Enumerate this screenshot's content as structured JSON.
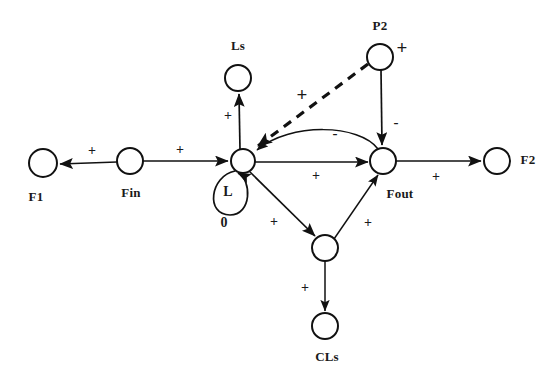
{
  "diagram": {
    "type": "signed-directed-graph",
    "background_color": "#ffffff",
    "stroke_color": "#111111",
    "nodes": [
      {
        "id": "F1",
        "label": "F1",
        "cx": 43,
        "cy": 163,
        "r": 14,
        "label_x": 36,
        "label_y": 197
      },
      {
        "id": "Fin",
        "label": "Fin",
        "cx": 130,
        "cy": 161,
        "r": 13,
        "label_x": 131,
        "label_y": 193
      },
      {
        "id": "L",
        "label": "",
        "cx": 243,
        "cy": 161,
        "r": 12,
        "label_x": 0,
        "label_y": 0
      },
      {
        "id": "Ls",
        "label": "Ls",
        "cx": 238,
        "cy": 78,
        "r": 13,
        "label_x": 238,
        "label_y": 46
      },
      {
        "id": "P2",
        "label": "P2",
        "cx": 380,
        "cy": 57,
        "r": 13,
        "label_x": 380,
        "label_y": 26
      },
      {
        "id": "Fout",
        "label": "Fout",
        "cx": 383,
        "cy": 161,
        "r": 13,
        "label_x": 400,
        "label_y": 194
      },
      {
        "id": "F2",
        "label": "F2",
        "cx": 497,
        "cy": 161,
        "r": 13,
        "label_x": 528,
        "label_y": 160
      },
      {
        "id": "CL",
        "label": "",
        "cx": 325,
        "cy": 248,
        "r": 13,
        "label_x": 0,
        "label_y": 0
      },
      {
        "id": "CLs",
        "label": "CLs",
        "cx": 325,
        "cy": 326,
        "r": 13,
        "label_x": 327,
        "label_y": 357
      }
    ],
    "self_loop": {
      "node": "L",
      "label": "L",
      "order": "0",
      "label_x": 228,
      "label_y": 192,
      "order_x": 224,
      "order_y": 223
    },
    "edges": [
      {
        "from": "Fin",
        "to": "F1",
        "sign": "+",
        "style": "solid",
        "sign_x": 92,
        "sign_y": 151
      },
      {
        "from": "Fin",
        "to": "L",
        "sign": "+",
        "style": "solid",
        "sign_x": 180,
        "sign_y": 150
      },
      {
        "from": "L",
        "to": "Ls",
        "sign": "+",
        "style": "solid",
        "sign_x": 228,
        "sign_y": 116
      },
      {
        "from": "P2",
        "to": "L",
        "sign": "+",
        "style": "dashed",
        "sign_x": 302,
        "sign_y": 94
      },
      {
        "from": "P2",
        "to": "Fout",
        "sign": "-",
        "style": "solid",
        "sign_x": 396,
        "sign_y": 122
      },
      {
        "from": "Fout",
        "to": "L",
        "sign": "-",
        "style": "curve",
        "sign_x": 335,
        "sign_y": 133
      },
      {
        "from": "L",
        "to": "Fout",
        "sign": "+",
        "style": "solid",
        "sign_x": 316,
        "sign_y": 176
      },
      {
        "from": "Fout",
        "to": "F2",
        "sign": "+",
        "style": "solid",
        "sign_x": 436,
        "sign_y": 177
      },
      {
        "from": "L",
        "to": "CL",
        "sign": "+",
        "style": "solid",
        "sign_x": 274,
        "sign_y": 222
      },
      {
        "from": "CL",
        "to": "Fout",
        "sign": "+",
        "style": "solid",
        "sign_x": 368,
        "sign_y": 223
      },
      {
        "from": "CL",
        "to": "CLs",
        "sign": "+",
        "style": "solid",
        "sign_x": 305,
        "sign_y": 288
      }
    ],
    "p2_plus_badge": {
      "text": "+",
      "x": 402,
      "y": 47
    }
  }
}
